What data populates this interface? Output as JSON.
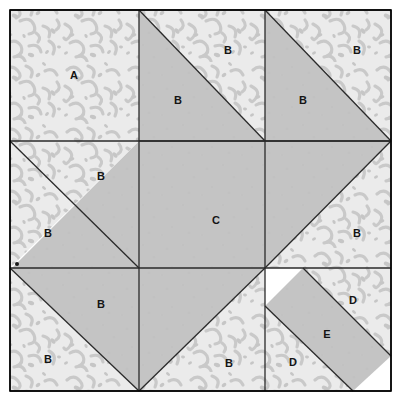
{
  "diagram": {
    "kind": "quilt-block-piecing-diagram",
    "canvas": {
      "width": 401,
      "height": 401
    },
    "frame": {
      "x": 10,
      "y": 10,
      "width": 381,
      "height": 381
    },
    "grid": {
      "vertical_lines": [
        139,
        265
      ],
      "horizontal_lines": [
        141,
        268
      ],
      "outer_left": 10,
      "outer_top": 10,
      "outer_right": 391,
      "outer_bottom": 391
    },
    "colors": {
      "fabric_dark": "#c4c4c4",
      "fabric_light": "#ebebeb",
      "fabric_light_print": "#c8c8c8",
      "outline": "#2a2a2a",
      "frame_border": "#000000",
      "label_text": "#141414",
      "page_background": "#ffffff"
    },
    "fabrics": [
      {
        "key": "dark",
        "name": "solid-gray-fabric",
        "fill": "#c4c4c4"
      },
      {
        "key": "light",
        "name": "light-print-fabric",
        "fill": "#ebebeb"
      }
    ],
    "marker_dot": {
      "x": 17,
      "y": 264,
      "r": 2,
      "name": "registration-dot"
    },
    "labels": [
      {
        "id": "A1",
        "text": "A",
        "x": 74,
        "y": 76
      },
      {
        "id": "B1",
        "text": "B",
        "x": 178,
        "y": 101
      },
      {
        "id": "B2",
        "text": "B",
        "x": 228,
        "y": 51
      },
      {
        "id": "B3",
        "text": "B",
        "x": 303,
        "y": 101
      },
      {
        "id": "B4",
        "text": "B",
        "x": 357,
        "y": 51
      },
      {
        "id": "B5",
        "text": "B",
        "x": 101,
        "y": 177
      },
      {
        "id": "B6",
        "text": "B",
        "x": 48,
        "y": 234
      },
      {
        "id": "C1",
        "text": "C",
        "x": 216,
        "y": 221
      },
      {
        "id": "B7",
        "text": "B",
        "x": 357,
        "y": 234
      },
      {
        "id": "B8",
        "text": "B",
        "x": 101,
        "y": 305
      },
      {
        "id": "B9",
        "text": "B",
        "x": 48,
        "y": 360
      },
      {
        "id": "B10",
        "text": "B",
        "x": 229,
        "y": 364
      },
      {
        "id": "D1",
        "text": "D",
        "x": 353,
        "y": 301
      },
      {
        "id": "E1",
        "text": "E",
        "x": 327,
        "y": 335
      },
      {
        "id": "D2",
        "text": "D",
        "x": 293,
        "y": 363
      }
    ],
    "pieces": [
      {
        "id": "p-a1",
        "label": "A",
        "fabric": "light",
        "points": "10,10 139,10 139,141 10,141",
        "name": "patch-a-top-left-square"
      },
      {
        "id": "p-b1",
        "label": "B",
        "fabric": "dark",
        "points": "139,10 139,141 265,141",
        "name": "patch-b-top-center-dark-triangle"
      },
      {
        "id": "p-b2",
        "label": "B",
        "fabric": "light",
        "points": "139,10 265,141 265,10",
        "name": "patch-b-top-center-light-triangle"
      },
      {
        "id": "p-b3",
        "label": "B",
        "fabric": "dark",
        "points": "265,10 265,141 391,141",
        "name": "patch-b-top-right-dark-triangle"
      },
      {
        "id": "p-b4",
        "label": "B",
        "fabric": "light",
        "points": "265,10 391,141 391,10",
        "name": "patch-b-top-right-light-triangle"
      },
      {
        "id": "p-b5",
        "label": "B",
        "fabric": "dark",
        "points": "139,141 139,268 12,268",
        "name": "patch-b-mid-left-dark-triangle"
      },
      {
        "id": "p-b6",
        "label": "B",
        "fabric": "light",
        "points": "10,141 139,141 10,268",
        "name": "patch-b-mid-left-light-triangle"
      },
      {
        "id": "p-c1",
        "label": "C",
        "fabric": "dark",
        "points": "139,141 391,141 265,268 139,391 139,141",
        "name": "patch-c-center-arrow"
      },
      {
        "id": "p-b7",
        "label": "B",
        "fabric": "light",
        "points": "391,141 391,268 265,268",
        "name": "patch-b-mid-right-light-triangle"
      },
      {
        "id": "p-b8",
        "label": "B",
        "fabric": "dark",
        "points": "10,268 139,268 139,391",
        "name": "patch-b-bottom-left-dark-triangle"
      },
      {
        "id": "p-b9",
        "label": "B",
        "fabric": "light",
        "points": "10,268 139,391 10,391",
        "name": "patch-b-bottom-left-light-triangle"
      },
      {
        "id": "p-b10",
        "label": "B",
        "fabric": "light",
        "points": "139,391 265,268 265,391",
        "name": "patch-b-bottom-center-light-triangle"
      },
      {
        "id": "p-d1",
        "label": "D",
        "fabric": "light",
        "points": "303,268 391,268 391,356",
        "name": "patch-d-upper-light-triangle"
      },
      {
        "id": "p-e1",
        "label": "E",
        "fabric": "dark",
        "points": "265,306 303,268 391,356 353,391",
        "name": "patch-e-diagonal-band"
      },
      {
        "id": "p-d2",
        "label": "D",
        "fabric": "light",
        "points": "265,306 353,391 265,391",
        "name": "patch-d-lower-light-triangle"
      }
    ],
    "seam_lines": [
      {
        "name": "seam-frame-top",
        "x1": 10,
        "y1": 10,
        "x2": 391,
        "y2": 10
      },
      {
        "name": "seam-frame-bottom",
        "x1": 10,
        "y1": 391,
        "x2": 391,
        "y2": 391
      },
      {
        "name": "seam-frame-left",
        "x1": 10,
        "y1": 10,
        "x2": 10,
        "y2": 391
      },
      {
        "name": "seam-frame-right",
        "x1": 391,
        "y1": 10,
        "x2": 391,
        "y2": 391
      },
      {
        "name": "seam-vertical-1",
        "x1": 139,
        "y1": 10,
        "x2": 139,
        "y2": 391
      },
      {
        "name": "seam-vertical-2",
        "x1": 265,
        "y1": 10,
        "x2": 265,
        "y2": 391
      },
      {
        "name": "seam-horizontal-1",
        "x1": 10,
        "y1": 141,
        "x2": 391,
        "y2": 141
      },
      {
        "name": "seam-horizontal-2",
        "x1": 10,
        "y1": 268,
        "x2": 265,
        "y2": 268
      },
      {
        "name": "seam-horizontal-2b",
        "x1": 265,
        "y1": 268,
        "x2": 391,
        "y2": 268
      },
      {
        "name": "seam-diag-top-center",
        "x1": 139,
        "y1": 10,
        "x2": 265,
        "y2": 141
      },
      {
        "name": "seam-diag-top-right",
        "x1": 265,
        "y1": 10,
        "x2": 391,
        "y2": 141
      },
      {
        "name": "seam-diag-mid-left",
        "x1": 10,
        "y1": 141,
        "x2": 139,
        "y2": 268
      },
      {
        "name": "seam-diag-bot-left",
        "x1": 10,
        "y1": 268,
        "x2": 139,
        "y2": 391
      },
      {
        "name": "seam-diag-center-ne",
        "x1": 139,
        "y1": 141,
        "x2": 391,
        "y2": 141
      },
      {
        "name": "seam-diag-arrow-up",
        "x1": 265,
        "y1": 268,
        "x2": 391,
        "y2": 141
      },
      {
        "name": "seam-diag-arrow-down",
        "x1": 265,
        "y1": 268,
        "x2": 139,
        "y2": 391
      },
      {
        "name": "seam-diag-e-upper",
        "x1": 303,
        "y1": 268,
        "x2": 391,
        "y2": 356
      },
      {
        "name": "seam-diag-e-lower",
        "x1": 265,
        "y1": 306,
        "x2": 353,
        "y2": 391
      }
    ]
  }
}
